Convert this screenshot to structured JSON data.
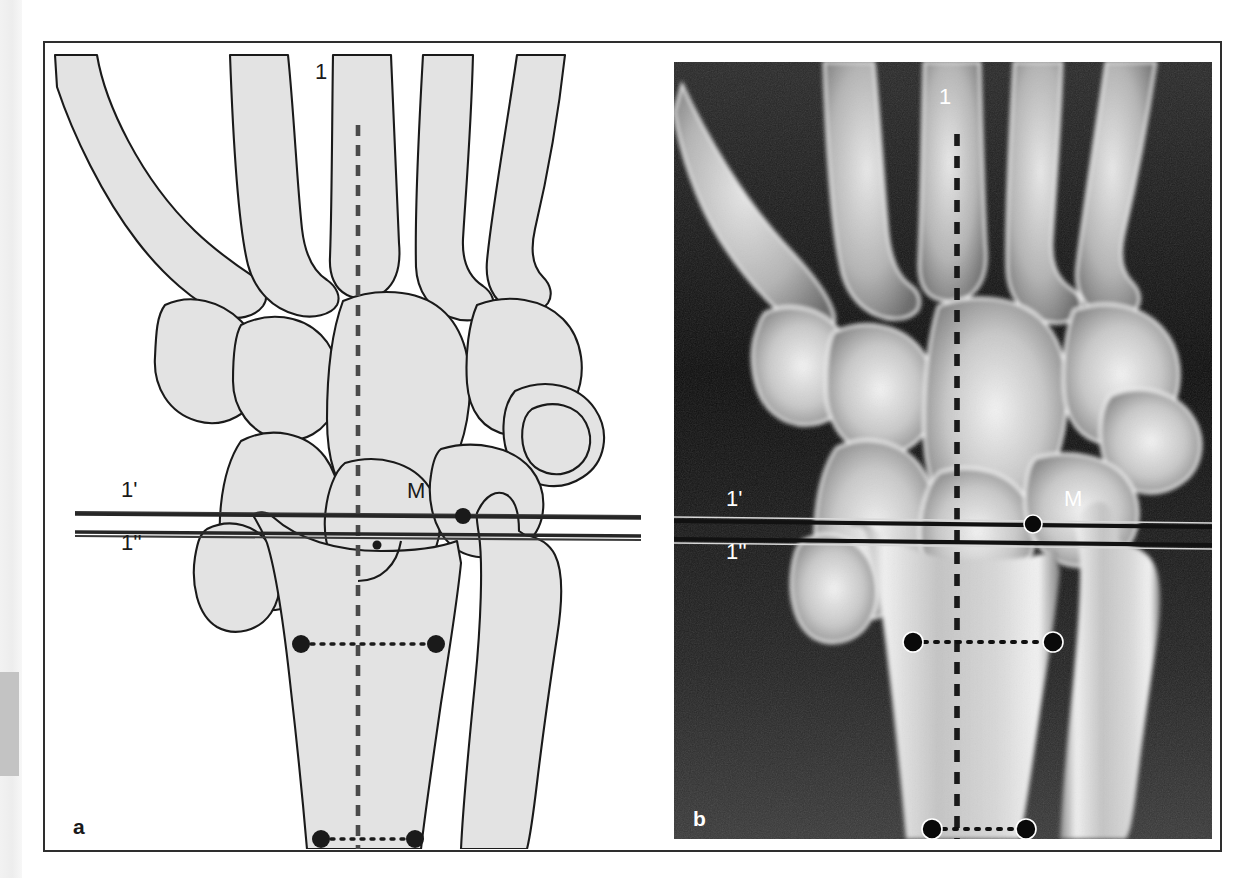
{
  "figure": {
    "panels": [
      {
        "id": "a",
        "letter": "a",
        "type": "line-diagram",
        "description": "Schematic line drawing of the wrist (posteroanterior view) showing metacarpals, carpal bones, distal radius and ulna with measurement reference lines",
        "annotations": {
          "axis_label": "1",
          "line_upper_label": "1'",
          "line_lower_label": "1''",
          "point_label": "M"
        }
      },
      {
        "id": "b",
        "letter": "b",
        "type": "radiograph",
        "description": "Corresponding posteroanterior wrist radiograph with the same reference lines and points superimposed",
        "annotations": {
          "axis_label": "1",
          "line_upper_label": "1'",
          "line_lower_label": "1''",
          "point_label": "M"
        }
      }
    ],
    "colors": {
      "bone_fill": "#e3e3e3",
      "bone_outline": "#1a1a1a",
      "frame": "#2e2e2e",
      "axis_line": "#3b3b3b",
      "reference_line": "#262626",
      "marker": "#1a1a1a",
      "xray_background": "#000000",
      "margin_strip": "#ededed",
      "margin_block": "#c3c3c3"
    },
    "measurements": {
      "longitudinal_axis": {
        "name": "1",
        "style": "dashed vertical line through third metacarpal, capitate, lunate and radial shaft"
      },
      "reference_line_upper": {
        "name": "1'",
        "style": "solid horizontal line tangent to the distal radial articular surface"
      },
      "reference_line_lower": {
        "name": "1''",
        "style": "solid horizontal line parallel to 1', tangent to the ulnar articular surface"
      },
      "point_M": {
        "name": "M",
        "style": "marker point on the ulnar side of the distal radius at the level of line 1'"
      },
      "shaft_width_proximal": {
        "style": "dotted horizontal caliper with filled end-points across the radial shaft"
      },
      "shaft_width_distal": {
        "style": "dotted horizontal caliper with filled end-points across the distal radial shaft"
      }
    }
  }
}
